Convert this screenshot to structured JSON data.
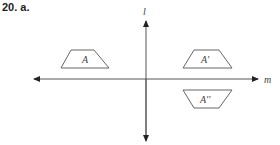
{
  "problem": {
    "number": "20.",
    "part": "a."
  },
  "axes": {
    "vertical_label": "l",
    "horizontal_label": "m"
  },
  "figures": [
    {
      "label": "A",
      "quadrant": "upper-left",
      "orientation": "upright"
    },
    {
      "label": "A'",
      "quadrant": "upper-right",
      "orientation": "upright"
    },
    {
      "label": "A''",
      "quadrant": "lower-right",
      "orientation": "inverted"
    }
  ],
  "colors": {
    "line": "#555555",
    "text": "#222222",
    "background": "#ffffff"
  }
}
